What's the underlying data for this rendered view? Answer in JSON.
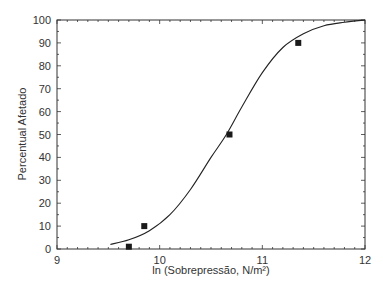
{
  "chart_data": {
    "type": "scatter",
    "title": "",
    "xlabel": "ln (Sobrepressão, N/m²)",
    "ylabel": "Percentual Afetado",
    "xlim": [
      9,
      12
    ],
    "ylim": [
      0,
      100
    ],
    "x_ticks": [
      9,
      10,
      11,
      12
    ],
    "y_ticks": [
      0,
      10,
      20,
      30,
      40,
      50,
      60,
      70,
      80,
      90,
      100
    ],
    "grid": false,
    "legend": null,
    "series": [
      {
        "name": "Dados",
        "kind": "scatter",
        "marker": "square",
        "x": [
          9.7,
          9.85,
          10.68,
          11.35
        ],
        "y": [
          1,
          10,
          50,
          90
        ]
      },
      {
        "name": "Curva ajustada",
        "kind": "line",
        "x": [
          9.52,
          9.7,
          9.9,
          10.1,
          10.3,
          10.5,
          10.65,
          10.8,
          11.0,
          11.2,
          11.4,
          11.6,
          11.8,
          12.0
        ],
        "y": [
          2,
          4,
          8,
          15,
          26,
          40,
          50,
          62,
          77,
          88,
          94,
          97.5,
          99,
          100
        ]
      }
    ]
  },
  "colors": {
    "axis": "#333333",
    "line": "#222222",
    "marker": "#1a1a1a"
  }
}
